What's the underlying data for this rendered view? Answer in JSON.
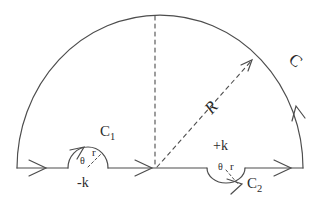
{
  "diagram": {
    "type": "complex-contour-integration",
    "colors": {
      "line": "#4d4d4d",
      "text": "#2b2b2b",
      "background": "#ffffff"
    },
    "labels": {
      "outer_arc": "C",
      "radius": "R",
      "small_arc_left": {
        "base": "C",
        "sub": "1"
      },
      "small_arc_right": {
        "base": "C",
        "sub": "2"
      },
      "pole_left": "-k",
      "pole_right": "+k",
      "left_r": "r",
      "left_theta": "θ",
      "right_theta": "θ",
      "right_r": "r"
    }
  }
}
